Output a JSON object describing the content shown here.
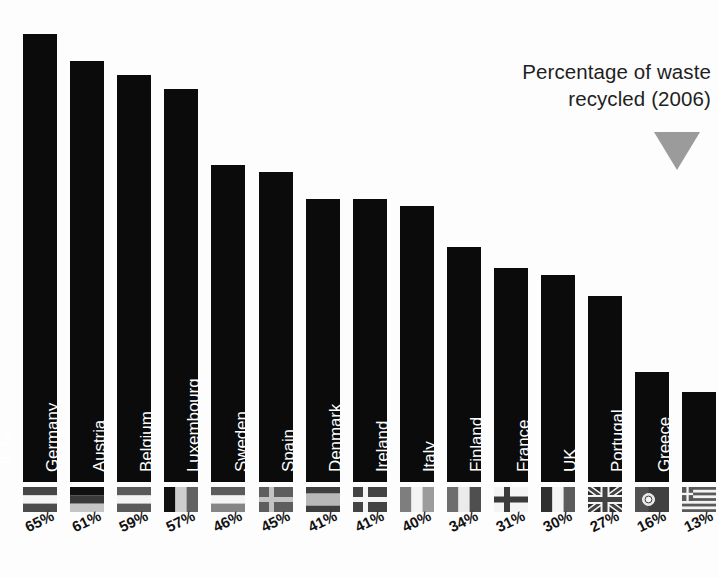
{
  "title": {
    "line1": "Percentage of waste",
    "line2": "recycled (2006)",
    "marker_color": "#9b9b9b"
  },
  "chart_data": {
    "type": "bar",
    "title": "Percentage of waste recycled (2006)",
    "xlabel": "",
    "ylabel": "Percentage of waste recycled",
    "ylim": [
      0,
      70
    ],
    "grid": false,
    "legend": "none",
    "bar_color": "#0b0b0b",
    "categories": [
      "Netherlands",
      "Germany",
      "Austria",
      "Belgium",
      "Luxembourg",
      "Sweden",
      "Spain",
      "Denmark",
      "Ireland",
      "Italy",
      "Finland",
      "France",
      "UK",
      "Portugal",
      "Greece"
    ],
    "values": [
      65,
      61,
      59,
      57,
      46,
      45,
      41,
      41,
      40,
      34,
      31,
      30,
      27,
      16,
      13
    ],
    "value_labels": [
      "65%",
      "61%",
      "59%",
      "57%",
      "46%",
      "45%",
      "41%",
      "41%",
      "40%",
      "34%",
      "31%",
      "30%",
      "27%",
      "16%",
      "13%"
    ],
    "flags": [
      "netherlands-flag",
      "germany-flag",
      "austria-flag",
      "belgium-flag",
      "luxembourg-flag",
      "sweden-flag",
      "spain-flag",
      "denmark-flag",
      "ireland-flag",
      "italy-flag",
      "finland-flag",
      "france-flag",
      "uk-flag",
      "portugal-flag",
      "greece-flag"
    ]
  }
}
